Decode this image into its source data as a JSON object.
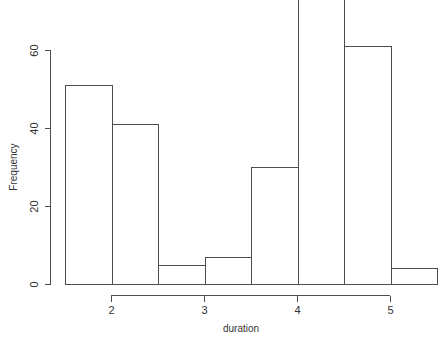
{
  "chart_data": {
    "type": "bar",
    "title": "",
    "subtitle": "",
    "xlabel": "duration",
    "ylabel": "Frequency",
    "categories": [
      "1.5-2",
      "2-2.5",
      "2.5-3",
      "3-3.5",
      "3.5-4",
      "4-4.5",
      "4.5-5",
      "5-5.5"
    ],
    "bin_edges": [
      1.5,
      2,
      2.5,
      3,
      3.5,
      4,
      4.5,
      5,
      5.5
    ],
    "values": [
      51,
      41,
      5,
      7,
      30,
      73,
      61,
      4
    ],
    "xlim": [
      1.5,
      5.5
    ],
    "ylim": [
      0,
      73
    ],
    "x_ticks": [
      2,
      3,
      4,
      5
    ],
    "x_tick_labels": [
      "2",
      "3",
      "4",
      "5"
    ],
    "y_ticks": [
      0,
      20,
      40,
      60
    ],
    "y_tick_labels": [
      "0",
      "20",
      "40",
      "60"
    ],
    "grid": false,
    "legend": null,
    "bar_fill": "#ffffff",
    "bar_stroke": "#4d4d4d",
    "background": "#ffffff"
  },
  "axes": {
    "x_title": "duration",
    "y_title": "Frequency"
  }
}
